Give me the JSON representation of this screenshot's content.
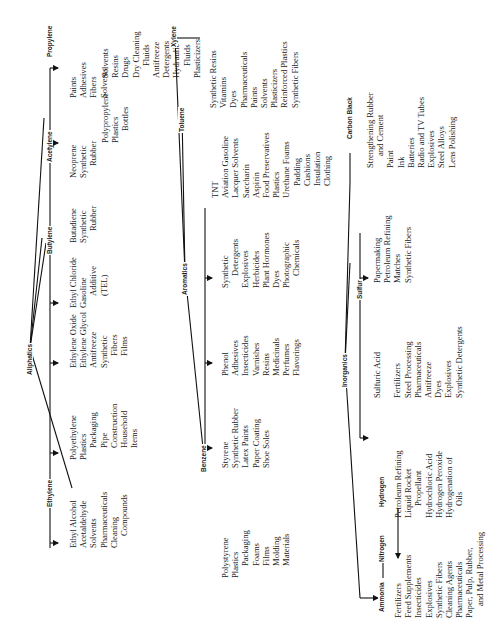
{
  "aliphatics": {
    "label": "Aliphatics",
    "ethylene": {
      "label": "Ethylene",
      "ethyl_alcohol": {
        "product": "Ethyl Alcohol",
        "uses": [
          "Acetaldehyde",
          "Solvents",
          "Pharmaceuticals",
          "Cleaning",
          "Compounds"
        ]
      },
      "polyethylene": {
        "product": "Polyethylene",
        "sub": "Plastics",
        "uses": [
          "Packaging",
          "Pipe",
          "Construction",
          "Household",
          "Items"
        ]
      },
      "ethylene_oxide": {
        "product": "Ethylene Oxide",
        "sub": "Ethylene Glycol",
        "uses": [
          "Antifreeze",
          "Synthetic",
          "Fibers",
          "Films"
        ]
      },
      "ethyl_chloride": {
        "product": "Ethyl Chloride",
        "uses": [
          "Gasoline",
          "Additive",
          "(TEL)"
        ]
      }
    },
    "butylene": {
      "label": "Butylene",
      "product": "Butadiene",
      "uses": [
        "Synthetic",
        "Rubber"
      ]
    },
    "acetylene": {
      "label": "Acetylene",
      "neoprene": {
        "product": "Neoprene",
        "uses": [
          "Synthetic",
          "Rubber"
        ]
      },
      "direct": [
        "Paints",
        "Adhesives",
        "Fibers",
        "Solvents"
      ]
    },
    "propylene": {
      "label": "Propylene",
      "polypropylene": {
        "product": "Polypropylene",
        "uses": [
          "Plastics",
          "Bottles"
        ]
      },
      "direct": [
        "Solvents",
        "Resins",
        "Drugs",
        "Dry Cleaning",
        "Fluids",
        "Antifreeze",
        "Detergents",
        "Hydraulic",
        "Fluids",
        "Plasticizers"
      ]
    }
  },
  "aromatics": {
    "label": "Aromatics",
    "benzene": {
      "label": "Benzene",
      "styrene": {
        "product": "Styrene",
        "uses": [
          "Synthetic Rubber",
          "Latex Paints",
          "Paper Coating",
          "Shoe Soles"
        ],
        "polystyrene": {
          "product": "Polystyrene",
          "uses": [
            "Plastics",
            "Packaging",
            "Foams",
            "Films",
            "Molding",
            "Materials"
          ]
        }
      },
      "phenol": {
        "product": "Phenol",
        "uses": [
          "Adhesives",
          "Insecticides",
          "Varnishes",
          "Resins",
          "Medicinals",
          "Perfumes",
          "Flavorings"
        ]
      },
      "direct": [
        "Synthetic",
        "Detergents",
        "Explosives",
        "Herbicides",
        "Plant Hormones",
        "Dyes",
        "Photographic",
        "Chemicals"
      ]
    },
    "toluene": {
      "label": "Toluene",
      "uses": [
        "TNT",
        "Aviation Gasoline",
        "Lacquer Solvents",
        "Saccharin",
        "Aspirin",
        "Food Preservatives",
        "Plastics",
        "Urethane Foams",
        "Padding",
        "Cushions",
        "Insulation",
        "Clothing"
      ]
    },
    "xylene": {
      "label": "Xylene",
      "uses": [
        "Synthetic Resins",
        "Vitamins",
        "Dyes",
        "Pharmaceuticals",
        "Paints",
        "Solvents",
        "Plasticizers",
        "Reinforced Plastics",
        "Synthetic Fibers"
      ]
    }
  },
  "inorganics": {
    "label": "Inorganics",
    "ammonia": {
      "label": "Ammonia",
      "uses": [
        "Fertilizers",
        "Feed Supplements",
        "Insecticides",
        "Explosives",
        "Synthetic Fibers",
        "Cleaning Agents",
        "Pharmaceuticals",
        "Paper, Pulp, Rubber,",
        "and Metal Processing"
      ]
    },
    "nitrogen": {
      "label": "Nitrogen"
    },
    "hydrogen": {
      "label": "Hydrogen",
      "uses": [
        "Petroleum Refining",
        "Liquid Rocket",
        "Propellant",
        "Hydrochloric Acid",
        "Hydrogen Peroxide",
        "Hydrogenation of",
        "Oils"
      ]
    },
    "sulfur": {
      "label": "Sulfur",
      "sulfuric_acid": {
        "product": "Sulfuric Acid",
        "uses": [
          "Fertilizers",
          "Steel Processing",
          "Pharmaceuticals",
          "Antifreeze",
          "Dyes",
          "Explosives",
          "Synthetic Detergents"
        ]
      },
      "direct": [
        "Papermaking",
        "Petroleum Refining",
        "Matches",
        "Synthetic Fibers"
      ]
    },
    "carbon_black": {
      "label": "Carbon Black",
      "uses": [
        "Strengthening Rubber",
        "and Cement",
        "Paint",
        "Ink",
        "Batteries",
        "Radio and TV Tubes",
        "Explosives",
        "Steel Alloys",
        "Lens Polishing"
      ]
    }
  }
}
